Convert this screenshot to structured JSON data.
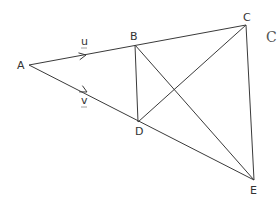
{
  "diagram": {
    "type": "geometry-vector-figure",
    "points": [
      {
        "id": "A",
        "label": "A",
        "x": 29,
        "y": 65,
        "label_x": 17,
        "label_y": 69
      },
      {
        "id": "B",
        "label": "B",
        "x": 135,
        "y": 45,
        "label_x": 130,
        "label_y": 40
      },
      {
        "id": "C",
        "label": "C",
        "x": 246,
        "y": 25,
        "label_x": 243,
        "label_y": 21
      },
      {
        "id": "D",
        "label": "D",
        "x": 138,
        "y": 122,
        "label_x": 135,
        "label_y": 135
      },
      {
        "id": "E",
        "label": "E",
        "x": 254,
        "y": 180,
        "label_x": 250,
        "label_y": 194
      }
    ],
    "segments": [
      {
        "from": "A",
        "to": "C",
        "name": "segment-A-C"
      },
      {
        "from": "A",
        "to": "E",
        "name": "segment-A-E"
      },
      {
        "from": "B",
        "to": "D",
        "name": "segment-B-D"
      },
      {
        "from": "B",
        "to": "E",
        "name": "segment-B-E"
      },
      {
        "from": "D",
        "to": "C",
        "name": "segment-D-C"
      },
      {
        "from": "C",
        "to": "E",
        "name": "segment-C-E"
      }
    ],
    "vectors": [
      {
        "id": "u",
        "label": "u",
        "on": "A-B",
        "label_x": 81,
        "label_y": 45,
        "arrow_x": 86,
        "arrow_y": 55
      },
      {
        "id": "v",
        "label": "v",
        "on": "A-D",
        "label_x": 81,
        "label_y": 104,
        "arrow_x": 87,
        "arrow_y": 92
      }
    ],
    "edge_text": {
      "label": "C",
      "x": 266,
      "y": 42
    }
  }
}
